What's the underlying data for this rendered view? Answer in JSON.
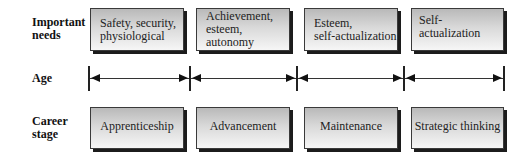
{
  "rows": {
    "needs_label": "Important needs",
    "needs_label_line1": "Important",
    "needs_label_line2": "needs",
    "age_label": "Age",
    "career_label_line1": "Career",
    "career_label_line2": "stage"
  },
  "needs": [
    {
      "line1": "Safety, security,",
      "line2": "physiological"
    },
    {
      "line1": "Achievement,",
      "line2": "esteem, autonomy"
    },
    {
      "line1": "Esteem,",
      "line2": "self-actualization"
    },
    {
      "line1": "Self-actualization",
      "line2": ""
    }
  ],
  "career_stages": [
    {
      "label": "Apprenticeship"
    },
    {
      "label": "Advancement"
    },
    {
      "label": "Maintenance"
    },
    {
      "label": "Strategic thinking"
    }
  ],
  "colors": {
    "box_gradient_top": "#b9b9b9",
    "box_gradient_bottom": "#f6f6f6",
    "box_shadow": "#1c1c1c",
    "line": "#333333"
  }
}
